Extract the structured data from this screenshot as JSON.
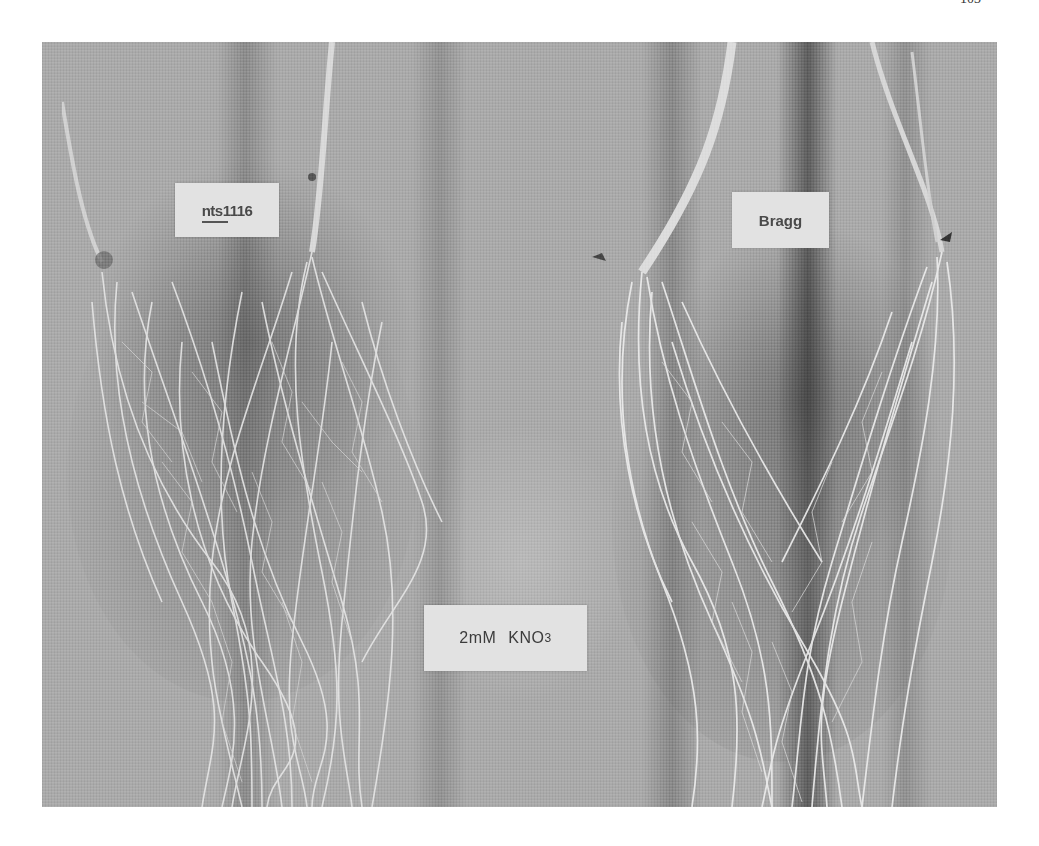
{
  "page": {
    "page_number": "103"
  },
  "figure": {
    "labels": {
      "left_genotype": "nts1116",
      "right_genotype": "Bragg",
      "treatment_main": "2mM",
      "treatment_compound": "KNO",
      "treatment_subscript": "3"
    },
    "colors": {
      "background_gray": "#a8a8a8",
      "card_fill": "#e2e2e2",
      "root_white": "#e8e8e8",
      "shadow_dark": "#5a5a5a"
    }
  }
}
